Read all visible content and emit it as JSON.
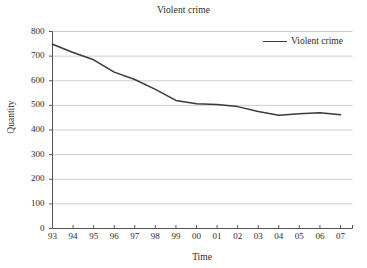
{
  "chart_data": {
    "type": "line",
    "title": "Violent crime",
    "xlabel": "Time",
    "ylabel": "Quantity",
    "categories": [
      "93",
      "94",
      "95",
      "96",
      "97",
      "98",
      "99",
      "00",
      "01",
      "02",
      "03",
      "04",
      "05",
      "06",
      "07"
    ],
    "series": [
      {
        "name": "Violent crime",
        "color": "#3a3a3a",
        "values": [
          748,
          715,
          685,
          635,
          605,
          565,
          520,
          507,
          504,
          495,
          475,
          460,
          466,
          470,
          462
        ]
      }
    ],
    "ylim": [
      0,
      800
    ],
    "y_ticks": [
      0,
      100,
      200,
      300,
      400,
      500,
      600,
      700,
      800
    ],
    "y_tick_labels": [
      "0",
      "100",
      "200",
      "300",
      "400",
      "500",
      "600",
      "700",
      "800"
    ],
    "grid": "horizontal",
    "grid_color": "#c8c8c8",
    "axis_color": "#555555",
    "legend_position": "top-right",
    "legend_entries": [
      "Violent crime"
    ]
  },
  "figure": {
    "title": "Violent crime",
    "x_axis_title": "Time",
    "y_axis_title": "Quantity",
    "legend_label": "Violent crime"
  }
}
